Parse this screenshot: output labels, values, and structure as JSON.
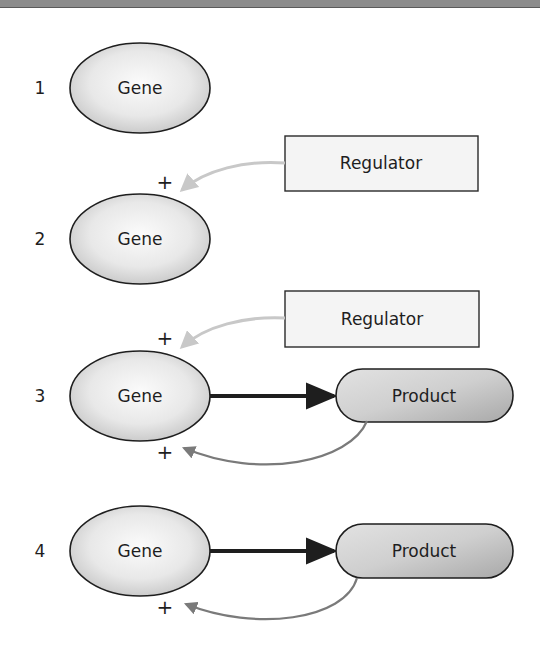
{
  "colors": {
    "topbar": "#8c8c8c",
    "node_stroke": "#1e1e1e",
    "gene_fill_light": "#fafafa",
    "gene_fill_dark": "#c9c9c9",
    "product_fill_light": "#e6e6e6",
    "product_fill_dark": "#a9a9a9",
    "regulator_fill": "#f4f4f4",
    "main_arrow": "#1e1e1e",
    "regulator_arrow": "#c8c8c8",
    "feedback_arrow": "#7a7a7a"
  },
  "rows": [
    {
      "number": "1",
      "gene": {
        "label": "Gene"
      }
    },
    {
      "number": "2",
      "gene": {
        "label": "Gene"
      },
      "regulator": {
        "label": "Regulator"
      },
      "regulator_sign": "+"
    },
    {
      "number": "3",
      "gene": {
        "label": "Gene"
      },
      "regulator": {
        "label": "Regulator"
      },
      "regulator_sign": "+",
      "product": {
        "label": "Product"
      },
      "feedback_sign": "+"
    },
    {
      "number": "4",
      "gene": {
        "label": "Gene"
      },
      "product": {
        "label": "Product"
      },
      "feedback_sign": "+"
    }
  ]
}
